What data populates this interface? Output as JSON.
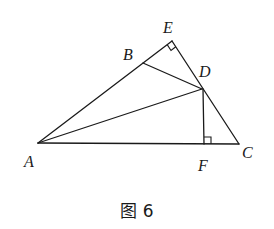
{
  "figure": {
    "caption": "图 6",
    "points": {
      "A": {
        "label": "A",
        "x": 38,
        "y": 143,
        "lx": 24,
        "ly": 166
      },
      "B": {
        "label": "B",
        "x": 143,
        "y": 63,
        "lx": 123,
        "ly": 60
      },
      "C": {
        "label": "C",
        "x": 239,
        "y": 144,
        "lx": 242,
        "ly": 158
      },
      "D": {
        "label": "D",
        "x": 202,
        "y": 89,
        "lx": 199,
        "ly": 77
      },
      "E": {
        "label": "E",
        "x": 172,
        "y": 41,
        "lx": 163,
        "ly": 32
      },
      "F": {
        "label": "F",
        "x": 204,
        "y": 144,
        "lx": 197,
        "ly": 170
      }
    },
    "segments": [
      "AE",
      "EC",
      "AC",
      "AD",
      "BD",
      "DF"
    ],
    "right_angles": [
      "AEC at E",
      "DFA at F"
    ]
  },
  "labels": {
    "A": "A",
    "B": "B",
    "C": "C",
    "D": "D",
    "E": "E",
    "F": "F"
  }
}
